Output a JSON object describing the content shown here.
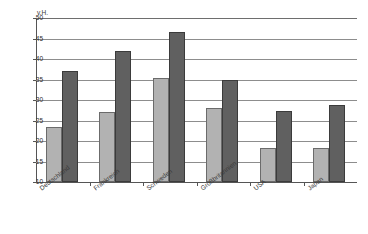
{
  "chart_data": {
    "type": "bar",
    "title": "",
    "clipped_title_text": "",
    "xlabel": "",
    "ylabel": "v.H.",
    "ylim": [
      10,
      50
    ],
    "ytick_step": 5,
    "yticks": [
      10,
      15,
      20,
      25,
      30,
      35,
      40,
      45,
      50
    ],
    "ytick_labels": [
      "10",
      "15",
      "20",
      "25",
      "30",
      "35",
      "40",
      "45",
      "50"
    ],
    "grid": true,
    "legend": "none",
    "categories": [
      "Deutschland",
      "Frankreich",
      "Schweden",
      "Großbritannien",
      "USA",
      "Japan"
    ],
    "series": [
      {
        "name": "series-light",
        "color": "#b2b2b2",
        "values": [
          23.5,
          27.0,
          35.3,
          28.0,
          18.2,
          18.2
        ]
      },
      {
        "name": "series-dark",
        "color": "#606060",
        "values": [
          37.0,
          42.0,
          46.5,
          35.0,
          27.4,
          28.7
        ]
      }
    ]
  },
  "colors": {
    "light_bar": "#b2b2b2",
    "dark_bar": "#606060",
    "gridline": "#8d8d8d",
    "axis": "#555555",
    "background": "#ffffff"
  }
}
